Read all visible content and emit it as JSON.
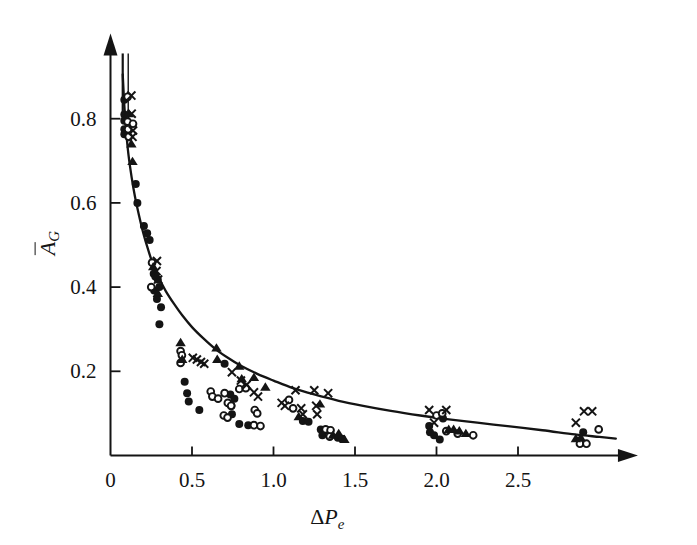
{
  "figure": {
    "background": "#ffffff",
    "ink_color": "#141414",
    "width": 697,
    "height": 545
  },
  "axes": {
    "x_title": "ΔP_e",
    "x_title_delta": "Δ",
    "x_title_base": "P",
    "x_title_sub": "e",
    "y_title": "Ā_G",
    "y_title_base": "A",
    "y_title_sub": "G",
    "y_title_overbar": true,
    "x_ticks": [
      "0",
      "0.5",
      "1.0",
      "1.5",
      "2.0",
      "2.5"
    ],
    "x_tick_values": [
      0,
      0.5,
      1.0,
      1.5,
      2.0,
      2.5
    ],
    "y_ticks": [
      "0.2",
      "0.4",
      "0.6",
      "0.8"
    ],
    "y_tick_values": [
      0.2,
      0.4,
      0.6,
      0.8
    ],
    "origin_label": "0",
    "x_arrow": true,
    "y_arrow": true
  },
  "chart_data": {
    "type": "scatter",
    "title": "",
    "subtitle": "",
    "xlabel": "ΔP_e",
    "ylabel": "Ā_G",
    "xlim": [
      0,
      3.15
    ],
    "ylim": [
      0,
      0.95
    ],
    "grid": false,
    "legend": "none",
    "x_ticks": [
      0,
      0.5,
      1.0,
      1.5,
      2.0,
      2.5
    ],
    "y_ticks": [
      0.2,
      0.4,
      0.6,
      0.8
    ],
    "annotations": [
      "Axes drawn as arrows extending beyond last tick",
      "Vertical error bar at x near 0.07 spanning high Ā_G values"
    ],
    "fit_curve": {
      "name": "fitted decay curve",
      "description": "monotonic decreasing curve through the data cloud",
      "points": [
        [
          0.075,
          0.905
        ],
        [
          0.085,
          0.83
        ],
        [
          0.095,
          0.775
        ],
        [
          0.11,
          0.715
        ],
        [
          0.13,
          0.66
        ],
        [
          0.15,
          0.615
        ],
        [
          0.175,
          0.57
        ],
        [
          0.2,
          0.53
        ],
        [
          0.23,
          0.49
        ],
        [
          0.26,
          0.455
        ],
        [
          0.3,
          0.42
        ],
        [
          0.34,
          0.39
        ],
        [
          0.39,
          0.36
        ],
        [
          0.44,
          0.333
        ],
        [
          0.5,
          0.305
        ],
        [
          0.57,
          0.278
        ],
        [
          0.64,
          0.254
        ],
        [
          0.72,
          0.232
        ],
        [
          0.8,
          0.213
        ],
        [
          0.9,
          0.194
        ],
        [
          1.0,
          0.178
        ],
        [
          1.12,
          0.16
        ],
        [
          1.25,
          0.145
        ],
        [
          1.4,
          0.13
        ],
        [
          1.55,
          0.118
        ],
        [
          1.72,
          0.106
        ],
        [
          1.9,
          0.095
        ],
        [
          2.05,
          0.087
        ],
        [
          2.25,
          0.078
        ],
        [
          2.45,
          0.069
        ],
        [
          2.65,
          0.06
        ],
        [
          2.85,
          0.05
        ],
        [
          3.0,
          0.044
        ],
        [
          3.1,
          0.04
        ]
      ]
    },
    "error_bar": {
      "x": 0.075,
      "y_low": 0.79,
      "y_high": 0.955,
      "cap_width": 0.0
    },
    "series": [
      {
        "name": "filled-circle",
        "marker": "filled-circle",
        "color": "#141414",
        "size": 8.0,
        "points": [
          [
            0.085,
            0.845
          ],
          [
            0.085,
            0.81
          ],
          [
            0.085,
            0.795
          ],
          [
            0.085,
            0.775
          ],
          [
            0.085,
            0.763
          ],
          [
            0.155,
            0.645
          ],
          [
            0.165,
            0.6
          ],
          [
            0.205,
            0.545
          ],
          [
            0.225,
            0.528
          ],
          [
            0.24,
            0.512
          ],
          [
            0.265,
            0.432
          ],
          [
            0.275,
            0.425
          ],
          [
            0.29,
            0.418
          ],
          [
            0.268,
            0.392
          ],
          [
            0.3,
            0.4
          ],
          [
            0.285,
            0.372
          ],
          [
            0.31,
            0.352
          ],
          [
            0.3,
            0.312
          ],
          [
            0.455,
            0.175
          ],
          [
            0.47,
            0.148
          ],
          [
            0.48,
            0.128
          ],
          [
            0.545,
            0.108
          ],
          [
            0.7,
            0.218
          ],
          [
            0.735,
            0.145
          ],
          [
            0.76,
            0.135
          ],
          [
            0.742,
            0.118
          ],
          [
            0.745,
            0.098
          ],
          [
            0.79,
            0.075
          ],
          [
            0.845,
            0.072
          ],
          [
            1.18,
            0.082
          ],
          [
            1.215,
            0.08
          ],
          [
            1.29,
            0.062
          ],
          [
            1.3,
            0.048
          ],
          [
            1.33,
            0.06
          ],
          [
            1.345,
            0.058
          ],
          [
            1.395,
            0.042
          ],
          [
            1.42,
            0.04
          ],
          [
            1.955,
            0.07
          ],
          [
            1.96,
            0.055
          ],
          [
            1.985,
            0.048
          ],
          [
            2.04,
            0.088
          ],
          [
            2.02,
            0.038
          ],
          [
            2.9,
            0.055
          ]
        ]
      },
      {
        "name": "open-circle",
        "marker": "open-circle",
        "color": "#141414",
        "size": 8.0,
        "points": [
          [
            0.105,
            0.852
          ],
          [
            0.105,
            0.793
          ],
          [
            0.108,
            0.775
          ],
          [
            0.138,
            0.788
          ],
          [
            0.112,
            0.757
          ],
          [
            0.255,
            0.458
          ],
          [
            0.25,
            0.4
          ],
          [
            0.43,
            0.248
          ],
          [
            0.438,
            0.238
          ],
          [
            0.43,
            0.22
          ],
          [
            0.615,
            0.152
          ],
          [
            0.625,
            0.14
          ],
          [
            0.66,
            0.135
          ],
          [
            0.7,
            0.148
          ],
          [
            0.72,
            0.125
          ],
          [
            0.74,
            0.118
          ],
          [
            0.695,
            0.095
          ],
          [
            0.718,
            0.09
          ],
          [
            0.79,
            0.158
          ],
          [
            0.83,
            0.16
          ],
          [
            0.885,
            0.108
          ],
          [
            0.9,
            0.1
          ],
          [
            0.88,
            0.072
          ],
          [
            0.92,
            0.07
          ],
          [
            1.095,
            0.132
          ],
          [
            1.12,
            0.112
          ],
          [
            1.32,
            0.062
          ],
          [
            1.35,
            0.06
          ],
          [
            1.345,
            0.045
          ],
          [
            2.0,
            0.095
          ],
          [
            2.035,
            0.1
          ],
          [
            2.06,
            0.058
          ],
          [
            2.13,
            0.052
          ],
          [
            2.225,
            0.048
          ],
          [
            2.88,
            0.028
          ],
          [
            2.92,
            0.028
          ],
          [
            2.995,
            0.062
          ]
        ]
      },
      {
        "name": "cross",
        "marker": "x-cross",
        "color": "#141414",
        "size": 8.5,
        "points": [
          [
            0.128,
            0.855
          ],
          [
            0.13,
            0.812
          ],
          [
            0.138,
            0.772
          ],
          [
            0.135,
            0.757
          ],
          [
            0.285,
            0.462
          ],
          [
            0.282,
            0.438
          ],
          [
            0.292,
            0.418
          ],
          [
            0.505,
            0.232
          ],
          [
            0.53,
            0.228
          ],
          [
            0.555,
            0.222
          ],
          [
            0.575,
            0.218
          ],
          [
            0.745,
            0.198
          ],
          [
            0.8,
            0.178
          ],
          [
            0.835,
            0.168
          ],
          [
            0.88,
            0.15
          ],
          [
            0.905,
            0.14
          ],
          [
            1.05,
            0.125
          ],
          [
            1.07,
            0.118
          ],
          [
            1.135,
            0.155
          ],
          [
            1.17,
            0.112
          ],
          [
            1.18,
            0.098
          ],
          [
            1.25,
            0.155
          ],
          [
            1.262,
            0.118
          ],
          [
            1.268,
            0.098
          ],
          [
            1.335,
            0.148
          ],
          [
            1.955,
            0.108
          ],
          [
            1.985,
            0.078
          ],
          [
            2.06,
            0.108
          ],
          [
            2.855,
            0.078
          ],
          [
            2.905,
            0.105
          ],
          [
            2.955,
            0.105
          ]
        ]
      },
      {
        "name": "filled-triangle",
        "marker": "filled-triangle",
        "color": "#141414",
        "size": 9.0,
        "points": [
          [
            0.112,
            0.812
          ],
          [
            0.128,
            0.74
          ],
          [
            0.135,
            0.698
          ],
          [
            0.262,
            0.448
          ],
          [
            0.29,
            0.385
          ],
          [
            0.43,
            0.268
          ],
          [
            0.44,
            0.228
          ],
          [
            0.65,
            0.255
          ],
          [
            0.655,
            0.228
          ],
          [
            0.79,
            0.212
          ],
          [
            0.805,
            0.182
          ],
          [
            0.88,
            0.185
          ],
          [
            0.95,
            0.162
          ],
          [
            1.155,
            0.092
          ],
          [
            1.285,
            0.122
          ],
          [
            1.365,
            0.048
          ],
          [
            1.4,
            0.052
          ],
          [
            1.435,
            0.038
          ],
          [
            2.075,
            0.062
          ],
          [
            2.105,
            0.062
          ],
          [
            2.14,
            0.058
          ],
          [
            2.18,
            0.052
          ],
          [
            2.855,
            0.04
          ],
          [
            2.885,
            0.042
          ]
        ]
      }
    ]
  }
}
